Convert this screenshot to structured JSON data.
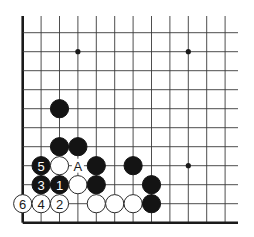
{
  "diagram": {
    "type": "go-board-corner",
    "corner": "bottom-left",
    "grid": {
      "columns": 12,
      "rows": 11,
      "origin_x": 22.7,
      "bottom_y": 222.7,
      "col_spacing": 18.4,
      "row_spacing": 19.0,
      "line_extend_top": 16,
      "line_extend_right": 238
    },
    "star_points": [
      {
        "col": 3,
        "row": 9
      },
      {
        "col": 9,
        "row": 9
      },
      {
        "col": 9,
        "row": 3
      }
    ],
    "stones": [
      {
        "color": "black",
        "col": 2,
        "row": 6,
        "label": ""
      },
      {
        "color": "black",
        "col": 2,
        "row": 4,
        "label": ""
      },
      {
        "color": "black",
        "col": 3,
        "row": 4,
        "label": ""
      },
      {
        "color": "black",
        "col": 1,
        "row": 3,
        "label": "5"
      },
      {
        "color": "white",
        "col": 2,
        "row": 3,
        "label": ""
      },
      {
        "color": "black",
        "col": 4,
        "row": 3,
        "label": ""
      },
      {
        "color": "black",
        "col": 6,
        "row": 3,
        "label": ""
      },
      {
        "color": "black",
        "col": 1,
        "row": 2,
        "label": "3"
      },
      {
        "color": "black",
        "col": 2,
        "row": 2,
        "label": "1"
      },
      {
        "color": "white",
        "col": 3,
        "row": 2,
        "label": ""
      },
      {
        "color": "black",
        "col": 4,
        "row": 2,
        "label": ""
      },
      {
        "color": "black",
        "col": 7,
        "row": 2,
        "label": ""
      },
      {
        "color": "white",
        "col": 0,
        "row": 1,
        "label": "6"
      },
      {
        "color": "white",
        "col": 1,
        "row": 1,
        "label": "4"
      },
      {
        "color": "white",
        "col": 2,
        "row": 1,
        "label": "2"
      },
      {
        "color": "white",
        "col": 4,
        "row": 1,
        "label": ""
      },
      {
        "color": "white",
        "col": 5,
        "row": 1,
        "label": ""
      },
      {
        "color": "white",
        "col": 6,
        "row": 1,
        "label": ""
      },
      {
        "color": "black",
        "col": 7,
        "row": 1,
        "label": ""
      }
    ],
    "point_labels": [
      {
        "col": 3,
        "row": 3,
        "text": "A"
      }
    ],
    "colors": {
      "black_stone": "#141414",
      "white_stone": "#ffffff",
      "line": "#3a3a3a"
    }
  }
}
